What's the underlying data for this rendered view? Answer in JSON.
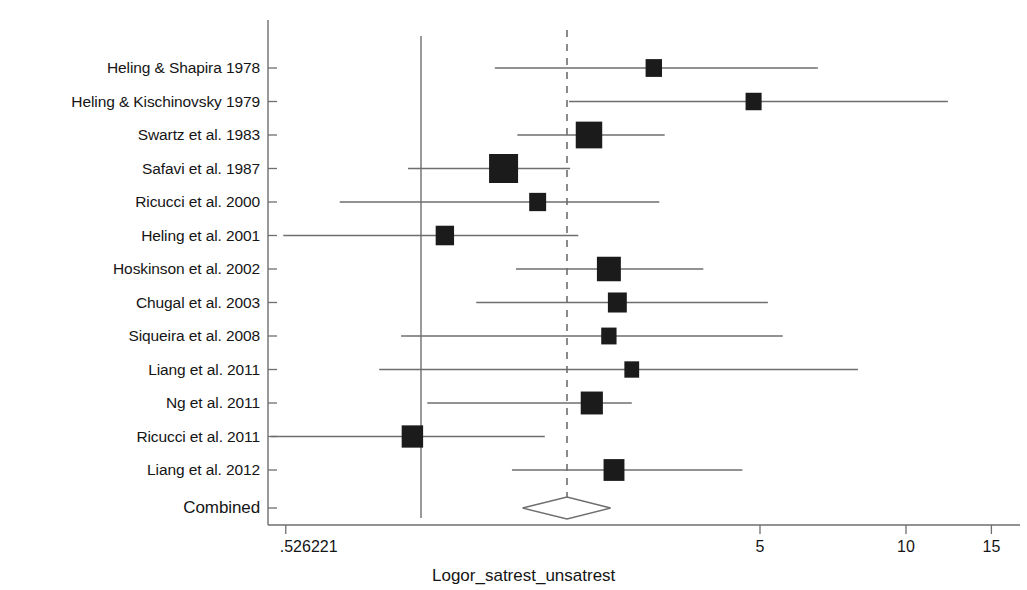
{
  "chart_data": {
    "type": "forest",
    "title": "",
    "xlabel": "Logor_satrest_unsatrest",
    "ylabel": "",
    "scale": "log",
    "xlim": [
      0.526221,
      15
    ],
    "grid": false,
    "null_line": 1,
    "pooled_line": 2.0,
    "xticks": [
      {
        "label": ".526221",
        "value": 0.526221
      },
      {
        "label": "5",
        "value": 5
      },
      {
        "label": "10",
        "value": 10
      },
      {
        "label": "15",
        "value": 15
      }
    ],
    "categories": [
      "Heling & Shapira 1978",
      "Heling & Kischinovsky 1979",
      "Swartz et al. 1983",
      "Safavi et al. 1987",
      "Ricucci et al. 2000",
      "Heling et al. 2001",
      "Hoskinson et al. 2002",
      "Chugal et al. 2003",
      "Siqueira et al. 2008",
      "Liang et al. 2011",
      "Ng et al. 2011",
      "Ricucci et al. 2011",
      "Liang et al. 2012"
    ],
    "studies": [
      {
        "label": "Heling & Shapira 1978",
        "estimate": 3.02,
        "ci_low": 1.42,
        "ci_high": 6.58,
        "weight": 0.3
      },
      {
        "label": "Heling & Kischinovsky 1979",
        "estimate": 4.85,
        "ci_low": 2.02,
        "ci_high": 12.2,
        "weight": 0.28
      },
      {
        "label": "Swartz et al. 1983",
        "estimate": 2.22,
        "ci_low": 1.58,
        "ci_high": 3.18,
        "weight": 0.86
      },
      {
        "label": "Safavi et al. 1987",
        "estimate": 1.48,
        "ci_low": 0.94,
        "ci_high": 2.03,
        "weight": 1.0
      },
      {
        "label": "Ricucci et al. 2000",
        "estimate": 1.74,
        "ci_low": 0.68,
        "ci_high": 3.1,
        "weight": 0.33
      },
      {
        "label": "Heling et al. 2001",
        "estimate": 1.12,
        "ci_low": 0.52,
        "ci_high": 2.11,
        "weight": 0.41
      },
      {
        "label": "Hoskinson et al. 2002",
        "estimate": 2.44,
        "ci_low": 1.57,
        "ci_high": 3.82,
        "weight": 0.72
      },
      {
        "label": "Chugal et al. 2003",
        "estimate": 2.54,
        "ci_low": 1.3,
        "ci_high": 5.19,
        "weight": 0.44
      },
      {
        "label": "Siqueira et al. 2008",
        "estimate": 2.44,
        "ci_low": 0.91,
        "ci_high": 5.57,
        "weight": 0.24
      },
      {
        "label": "Liang et al. 2011",
        "estimate": 2.72,
        "ci_low": 0.82,
        "ci_high": 7.96,
        "weight": 0.21
      },
      {
        "label": "Ng et al. 2011",
        "estimate": 2.25,
        "ci_low": 1.03,
        "ci_high": 2.72,
        "weight": 0.62
      },
      {
        "label": "Ricucci et al. 2011",
        "estimate": 0.96,
        "ci_low": 0.49,
        "ci_high": 1.8,
        "weight": 0.58
      },
      {
        "label": "Liang et al. 2012",
        "estimate": 2.5,
        "ci_low": 1.54,
        "ci_high": 4.6,
        "weight": 0.55
      }
    ],
    "combined": {
      "label": "Combined",
      "estimate": 2.0,
      "ci_low": 1.62,
      "ci_high": 2.46
    }
  }
}
